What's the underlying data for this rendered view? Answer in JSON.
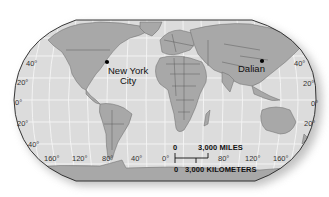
{
  "map": {
    "projection": "Robinson-style world map",
    "colors": {
      "ocean": "#dcdcdc",
      "land": "#a8a8a8",
      "land_dark": "#8e8e8e",
      "border": "#555555",
      "graticule": "#f4f4f4",
      "outline": "#222222"
    },
    "cities": [
      {
        "name": "New York City",
        "line1": "New York",
        "line2": "City"
      },
      {
        "name": "Dalian",
        "line1": "Dalian"
      }
    ],
    "latitude_labels_left": [
      "40°",
      "20°",
      "0°",
      "20°",
      "40°"
    ],
    "latitude_labels_right": [
      "40°",
      "20°",
      "0°",
      "20°"
    ],
    "longitude_labels": [
      "160°",
      "120°",
      "80°",
      "40°",
      "0°",
      "80°",
      "120°",
      "160°"
    ],
    "scale_bar": {
      "top_zero": "0",
      "miles_label": "3,000 MILES",
      "bottom_zero": "0",
      "km_label": "3,000 KILOMETERS"
    }
  }
}
